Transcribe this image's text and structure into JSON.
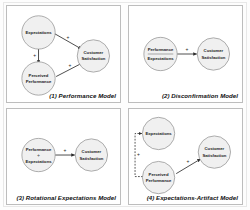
{
  "figure": {
    "panel_count": 4
  },
  "labels": {
    "expectations": "Expectations",
    "perceived_performance_line1": "Perceived",
    "perceived_performance_line2": "Performance",
    "customer_satisfaction_line1": "Customer",
    "customer_satisfaction_line2": "Satisfaction",
    "performance": "Performance",
    "expectations_alt": "Expectations",
    "minus_operator": "-",
    "divide_operator": "÷",
    "plus_sign": "+"
  },
  "panels": [
    {
      "id": "panel-1",
      "caption": "(1) Performance Model",
      "nodes": [
        {
          "name": "expectations",
          "label": "Expectations"
        },
        {
          "name": "perceived-performance",
          "label": "Perceived Performance"
        },
        {
          "name": "customer-satisfaction",
          "label": "Customer Satisfaction"
        }
      ],
      "edges": [
        {
          "from": "expectations",
          "to": "customer-satisfaction",
          "sign": "+",
          "style": "solid"
        },
        {
          "from": "expectations",
          "to": "perceived-performance",
          "sign": "+",
          "style": "solid"
        },
        {
          "from": "perceived-performance",
          "to": "customer-satisfaction",
          "sign": "+",
          "style": "solid"
        }
      ]
    },
    {
      "id": "panel-2",
      "caption": "(2) Disconfirmation Model",
      "nodes": [
        {
          "name": "performance-minus-expectations",
          "label": "Performance - Expectations"
        },
        {
          "name": "customer-satisfaction",
          "label": "Customer Satisfaction"
        }
      ],
      "edges": [
        {
          "from": "performance-minus-expectations",
          "to": "customer-satisfaction",
          "sign": "+",
          "style": "solid"
        }
      ]
    },
    {
      "id": "panel-3",
      "caption": "(3) Rotational Expectations Model",
      "nodes": [
        {
          "name": "performance-over-expectations",
          "label": "Performance ÷ Expectations"
        },
        {
          "name": "customer-satisfaction",
          "label": "Customer Satisfaction"
        }
      ],
      "edges": [
        {
          "from": "performance-over-expectations",
          "to": "customer-satisfaction",
          "sign": "+",
          "style": "solid"
        }
      ]
    },
    {
      "id": "panel-4",
      "caption": "(4) Expectations-Artifact Model",
      "nodes": [
        {
          "name": "expectations",
          "label": "Expectations"
        },
        {
          "name": "perceived-performance",
          "label": "Perceived Performance"
        },
        {
          "name": "customer-satisfaction",
          "label": "Customer Satisfaction"
        }
      ],
      "edges": [
        {
          "from": "perceived-performance",
          "to": "expectations",
          "sign": "+",
          "style": "dashed"
        },
        {
          "from": "perceived-performance",
          "to": "customer-satisfaction",
          "sign": "+",
          "style": "solid"
        }
      ]
    }
  ],
  "colors": {
    "node_fill": "#f0f0f0",
    "node_stroke": "#8a8a8a",
    "edge": "#2b2b2b",
    "panel_border": "#bdbdbd",
    "background": "#ffffff"
  }
}
